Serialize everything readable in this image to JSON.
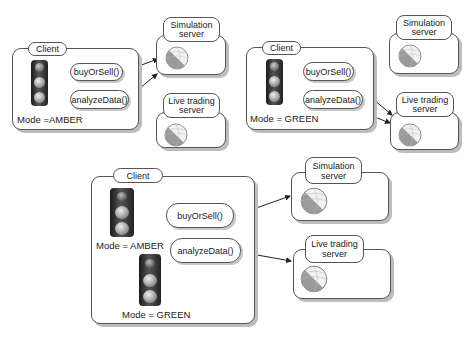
{
  "panels": [
    {
      "client": {
        "label": "Client",
        "mode": "Mode =AMBER"
      },
      "methods": [
        "buyOrSell()",
        "analyzeData()"
      ],
      "servers": [
        {
          "line1": "Simulation",
          "line2": "server"
        },
        {
          "line1": "Live trading",
          "line2": "server"
        }
      ]
    },
    {
      "client": {
        "label": "Client",
        "mode": "Mode = GREEN"
      },
      "methods": [
        "buyOrSell()",
        "analyzeData()"
      ],
      "servers": [
        {
          "line1": "Simulation",
          "line2": "server"
        },
        {
          "line1": "Live trading",
          "line2": "server"
        }
      ]
    },
    {
      "client": {
        "label": "Client",
        "mode_a": "Mode = AMBER",
        "mode_b": "Mode = GREEN"
      },
      "methods": [
        "buyOrSell()",
        "analyzeData()"
      ],
      "servers": [
        {
          "line1": "Simulation",
          "line2": "server"
        },
        {
          "line1": "Live trading",
          "line2": "server"
        }
      ]
    }
  ],
  "colors": {
    "stroke": "#555555",
    "shadow": "#bdbdbd",
    "light_body": "#222222"
  }
}
